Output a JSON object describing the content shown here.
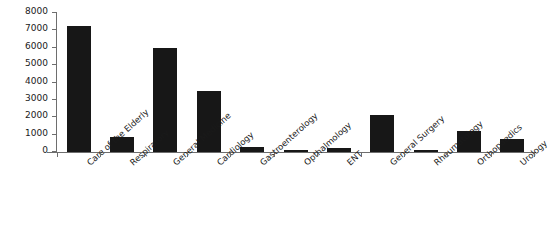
{
  "chart_data": {
    "type": "bar",
    "title": "",
    "subtitle": "",
    "xlabel": "",
    "ylabel": "",
    "ylim": [
      0,
      8000
    ],
    "grid": false,
    "legend": null,
    "legend_position": "none",
    "orientation": "vertical",
    "bar_color": "#171717",
    "axis_color": "#6e6e6e",
    "yticks": [
      0,
      1000,
      2000,
      3000,
      4000,
      5000,
      6000,
      7000,
      8000
    ],
    "ytick_labels": [
      "0",
      "1000",
      "2000",
      "3000",
      "4000",
      "5000",
      "6000",
      "7000",
      "8000"
    ],
    "categories": [
      "Care of the Elderly",
      "Respiratory",
      "General Medicine",
      "Cardiology",
      "Gastroenterology",
      "Opthalmology",
      "ENT",
      "General Surgery",
      "Rheumatology",
      "Orthopaedics",
      "Urology"
    ],
    "values": [
      7250,
      850,
      6000,
      3500,
      300,
      130,
      220,
      2150,
      90,
      1200,
      750
    ]
  }
}
